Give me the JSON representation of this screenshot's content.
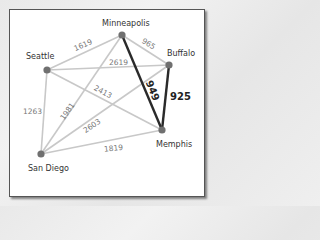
{
  "diagram": {
    "type": "weighted-graph",
    "nodes": [
      {
        "id": "minneapolis",
        "label": "Minneapolis",
        "x": 122,
        "y": 35
      },
      {
        "id": "buffalo",
        "label": "Buffalo",
        "x": 169,
        "y": 65
      },
      {
        "id": "seattle",
        "label": "Seattle",
        "x": 47,
        "y": 70
      },
      {
        "id": "memphis",
        "label": "Memphis",
        "x": 162,
        "y": 130
      },
      {
        "id": "sandiego",
        "label": "San Diego",
        "x": 41,
        "y": 154
      }
    ],
    "edges": [
      {
        "from": "seattle",
        "to": "minneapolis",
        "weight": "1619",
        "highlighted": false
      },
      {
        "from": "minneapolis",
        "to": "buffalo",
        "weight": "965",
        "highlighted": false
      },
      {
        "from": "seattle",
        "to": "buffalo",
        "weight": "2619",
        "highlighted": false
      },
      {
        "from": "seattle",
        "to": "memphis",
        "weight": "2413",
        "highlighted": false
      },
      {
        "from": "seattle",
        "to": "sandiego",
        "weight": "1263",
        "highlighted": false
      },
      {
        "from": "sandiego",
        "to": "minneapolis",
        "weight": "1981",
        "highlighted": false
      },
      {
        "from": "sandiego",
        "to": "buffalo",
        "weight": "2603",
        "highlighted": false
      },
      {
        "from": "sandiego",
        "to": "memphis",
        "weight": "1819",
        "highlighted": false
      },
      {
        "from": "minneapolis",
        "to": "memphis",
        "weight": "949",
        "highlighted": true
      },
      {
        "from": "buffalo",
        "to": "memphis",
        "weight": "925",
        "highlighted": true
      }
    ],
    "colors": {
      "edge": "#c8c8c8",
      "highlight_edge": "#2a2a2a",
      "node": "#707070",
      "frame_border": "#555555"
    }
  }
}
